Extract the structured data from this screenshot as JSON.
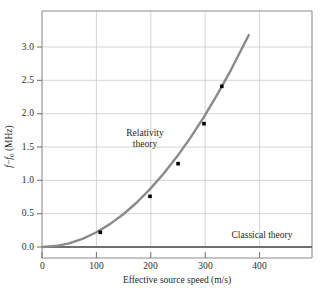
{
  "chart_data": {
    "type": "line",
    "title": "",
    "xlabel": "Effective source speed (m/s)",
    "ylabel": "f − f₀ (MHz)",
    "xlim": [
      0,
      500
    ],
    "ylim": [
      0.0,
      3.5
    ],
    "xticks": [
      0,
      100,
      200,
      300,
      400
    ],
    "xtick_labels": [
      "0",
      "100",
      "200",
      "300",
      "400"
    ],
    "yticks": [
      0.0,
      0.5,
      1.0,
      1.5,
      2.0,
      2.5,
      3.0
    ],
    "ytick_labels": [
      "0.0",
      "0.5",
      "1.0",
      "1.5",
      "2.0",
      "2.5",
      "3.0"
    ],
    "grid": true,
    "legend": "none",
    "series": [
      {
        "name": "Relativity theory",
        "kind": "curve",
        "color": "#8a8a8a",
        "annotation": [
          "Relativity",
          "theory"
        ],
        "annotation_x": 205,
        "annotation_y": 1.55,
        "relation": "quadratic: y = 2.17e-5 * v^2",
        "x": [
          0,
          25,
          50,
          75,
          100,
          125,
          150,
          175,
          200,
          225,
          250,
          275,
          300,
          325,
          350,
          383
        ],
        "y": [
          0.0,
          0.014,
          0.054,
          0.122,
          0.217,
          0.339,
          0.488,
          0.664,
          0.868,
          1.098,
          1.356,
          1.641,
          1.953,
          2.292,
          2.658,
          3.18
        ]
      },
      {
        "name": "Classical theory",
        "kind": "line",
        "color": "#6f6f6f",
        "annotation": [
          "Classical theory"
        ],
        "annotation_x": 320,
        "annotation_y": 0.16,
        "x": [
          0,
          500
        ],
        "y": [
          0.0,
          0.0
        ]
      }
    ],
    "data_points": {
      "name": "measured-data-points",
      "marker": "square",
      "color": "#000000",
      "x": [
        108,
        200,
        252,
        300,
        333
      ],
      "y": [
        0.22,
        0.76,
        1.25,
        1.85,
        2.41
      ]
    }
  },
  "axes": {
    "xlabel": "Effective source speed (m/s)",
    "ylabel_parts": {
      "f": "f",
      "minus": "−",
      "f0": "f",
      "sub": "0",
      "units": "(MHz)"
    }
  },
  "annotations": {
    "relativity_line1": "Relativity",
    "relativity_line2": "theory",
    "classical": "Classical theory"
  },
  "colors": {
    "curve": "#8a8a8a",
    "classical_line": "#6f6f6f",
    "grid": "#c9c9c9",
    "frame": "#8c8c8c",
    "marker": "#000000",
    "background": "#ffffff"
  }
}
